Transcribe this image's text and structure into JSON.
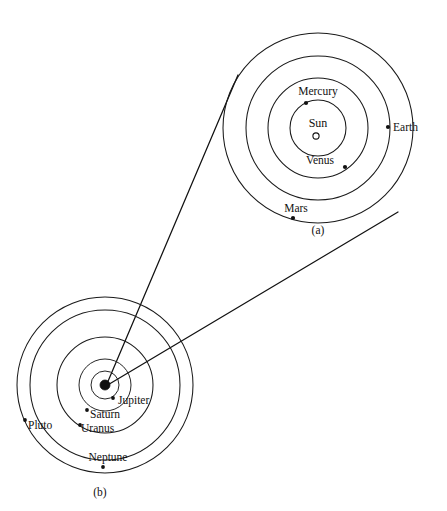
{
  "figure": {
    "background_color": "#ffffff",
    "line_color": "#111111",
    "width": 447,
    "height": 511
  },
  "panel_a": {
    "caption": "(a)",
    "caption_x": 318,
    "caption_y": 234,
    "center_x": 318,
    "center_y": 128,
    "description": "Inner solar system",
    "center_body": {
      "name": "Sun",
      "label": "Sun",
      "label_x": 318,
      "label_y": 127,
      "marker_x": 316,
      "marker_y": 136,
      "marker_radius": 3.1,
      "marker_style": "open-circle"
    },
    "orbits": [
      {
        "name": "Mercury",
        "label": "Mercury",
        "radius": 28,
        "label_x": 318,
        "label_y": 95,
        "label_anchor": "middle",
        "dot_x": 306,
        "dot_y": 103,
        "dot_r": 2.1
      },
      {
        "name": "Venus",
        "label": "Venus",
        "radius": 50,
        "label_x": 320,
        "label_y": 164,
        "label_anchor": "middle",
        "dot_x": 345,
        "dot_y": 167,
        "dot_r": 2.1
      },
      {
        "name": "Earth",
        "label": "Earth",
        "radius": 72,
        "label_x": 393,
        "label_y": 131,
        "label_anchor": "start",
        "dot_x": 388,
        "dot_y": 127,
        "dot_r": 2.1
      },
      {
        "name": "Mars",
        "label": "Mars",
        "radius": 95,
        "label_x": 296,
        "label_y": 212,
        "label_anchor": "middle",
        "dot_x": 293,
        "dot_y": 218,
        "dot_r": 2.1
      }
    ]
  },
  "panel_b": {
    "caption": "(b)",
    "caption_x": 100,
    "caption_y": 496,
    "center_x": 105,
    "center_y": 385,
    "description": "Outer solar system",
    "center_body": {
      "name": "inner-solar-system-blob",
      "marker_x": 105,
      "marker_y": 385,
      "marker_radius": 5.0,
      "marker_style": "filled-circle"
    },
    "orbits": [
      {
        "name": "Jupiter",
        "label": "Jupiter",
        "radius": 14,
        "label_x": 118,
        "label_y": 404,
        "label_anchor": "start",
        "dot_x": 113,
        "dot_y": 398,
        "dot_r": 1.9
      },
      {
        "name": "Saturn",
        "label": "Saturn",
        "radius": 26,
        "label_x": 90,
        "label_y": 418,
        "label_anchor": "start",
        "dot_x": 87,
        "dot_y": 410,
        "dot_r": 1.9
      },
      {
        "name": "Uranus",
        "label": "Uranus",
        "radius": 48,
        "label_x": 81,
        "label_y": 432,
        "label_anchor": "start",
        "dot_x": 80,
        "dot_y": 425,
        "dot_r": 1.9
      },
      {
        "name": "Neptune",
        "label": "Neptune",
        "radius": 75,
        "label_x": 108,
        "label_y": 461,
        "label_anchor": "middle",
        "dot_x": 103,
        "dot_y": 467,
        "dot_r": 1.9
      },
      {
        "name": "Pluto",
        "label": "Pluto",
        "radius": 88,
        "label_x": 28,
        "label_y": 429,
        "label_anchor": "start",
        "dot_x": 25,
        "dot_y": 420,
        "dot_r": 1.9
      }
    ]
  },
  "connectors": [
    {
      "name": "magnifier-line-upper",
      "x1": 106,
      "y1": 386,
      "x2": 238,
      "y2": 75
    },
    {
      "name": "magnifier-line-lower",
      "x1": 106,
      "y1": 386,
      "x2": 398,
      "y2": 212
    }
  ]
}
